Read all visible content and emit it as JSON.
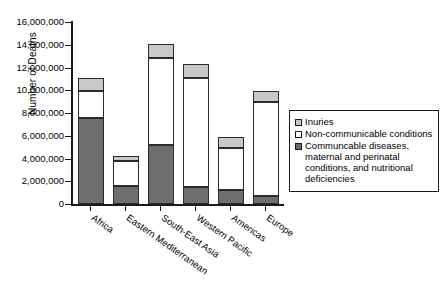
{
  "chart_data": {
    "type": "bar",
    "stacked": true,
    "title": "",
    "xlabel": "",
    "ylabel": "Number of Deaths",
    "ylim": [
      0,
      16000000
    ],
    "ytick_labels": [
      "16,000,000",
      "14,000,000",
      "12,000,000",
      "10,000,000",
      "8,000,000",
      "6,000,000",
      "4,000,000",
      "2,000,000",
      "0"
    ],
    "ytick_values": [
      16000000,
      14000000,
      12000000,
      10000000,
      8000000,
      6000000,
      4000000,
      2000000,
      0
    ],
    "grid": false,
    "legend_position": "right",
    "categories": [
      "Africa",
      "Eastern Mediterranean",
      "South-East Asia",
      "Western Pacific",
      "Americas",
      "Europe"
    ],
    "series": [
      {
        "name": "Communcable diseases, maternal and perinatal conditions, and nutritional deficiencies",
        "color": "#6e6e6e",
        "values": [
          7600000,
          1600000,
          5200000,
          1500000,
          1200000,
          700000
        ]
      },
      {
        "name": "Non-communicable conditions",
        "color": "#ffffff",
        "values": [
          2300000,
          2200000,
          7600000,
          9600000,
          3700000,
          8300000
        ]
      },
      {
        "name": "Inuries",
        "color": "#c8c8c8",
        "values": [
          1200000,
          450000,
          1300000,
          1200000,
          1000000,
          900000
        ]
      }
    ],
    "totals": [
      11100000,
      4250000,
      14100000,
      12300000,
      5900000,
      9900000
    ]
  },
  "legend": {
    "items": [
      {
        "label": "Inuries",
        "swatch": "light-gray"
      },
      {
        "label": "Non-communicable conditions",
        "swatch": "white"
      },
      {
        "label": "Communcable diseases, maternal and perinatal conditions, and nutritional deficiencies",
        "swatch": "dark-gray"
      }
    ]
  },
  "colors": {
    "injuries": "#c8c8c8",
    "noncommunicable": "#ffffff",
    "communicable": "#6e6e6e",
    "axis": "#1a1a1a",
    "background": "#ffffff"
  }
}
